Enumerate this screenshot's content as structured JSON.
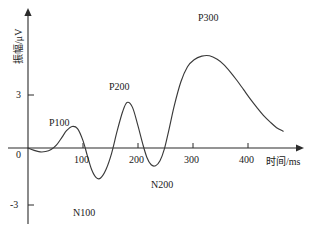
{
  "chart_data": {
    "type": "line",
    "title": "",
    "xlabel": "时间/ms",
    "ylabel": "振幅/μV",
    "xlim": [
      0,
      470
    ],
    "ylim": [
      -3.6,
      6.2
    ],
    "grid": false,
    "legend": "none",
    "x_ticks": [
      {
        "value": 100,
        "label": "100"
      },
      {
        "value": 200,
        "label": "200"
      },
      {
        "value": 300,
        "label": "300"
      },
      {
        "value": 400,
        "label": "400"
      }
    ],
    "y_ticks": [
      {
        "value": 3,
        "label": "3"
      },
      {
        "value": 0,
        "label": "0"
      },
      {
        "value": -3,
        "label": "-3"
      }
    ],
    "series": [
      {
        "name": "ERP waveform",
        "color": "#3a3a3a",
        "x": [
          0,
          10,
          22,
          32,
          42,
          52,
          62,
          70,
          80,
          90,
          100,
          108,
          116,
          124,
          132,
          142,
          152,
          162,
          172,
          180,
          190,
          200,
          208,
          216,
          224,
          232,
          240,
          248,
          256,
          266,
          278,
          290,
          302,
          316,
          330,
          344,
          356,
          368,
          380,
          392,
          404,
          416,
          428,
          440,
          452,
          464
        ],
        "y": [
          0.0,
          -0.12,
          -0.22,
          -0.2,
          -0.08,
          0.18,
          0.62,
          0.98,
          1.22,
          1.1,
          0.42,
          -0.45,
          -1.25,
          -1.68,
          -1.7,
          -1.2,
          -0.3,
          0.95,
          2.05,
          2.58,
          2.3,
          1.25,
          0.3,
          -0.52,
          -0.95,
          -1.0,
          -0.72,
          -0.05,
          1.0,
          2.4,
          3.75,
          4.6,
          5.0,
          5.2,
          5.22,
          5.02,
          4.72,
          4.3,
          3.82,
          3.3,
          2.78,
          2.3,
          1.85,
          1.48,
          1.15,
          0.95
        ]
      }
    ],
    "annotations": [
      {
        "name": "P100",
        "label": "P100",
        "x": 80,
        "y": 1.22,
        "peak": "positive"
      },
      {
        "name": "N100",
        "label": "N100",
        "x": 128,
        "y": -1.7,
        "peak": "negative"
      },
      {
        "name": "P200",
        "label": "P200",
        "x": 178,
        "y": 2.58,
        "peak": "positive"
      },
      {
        "name": "N200",
        "label": "N200",
        "x": 228,
        "y": -1.0,
        "peak": "negative"
      },
      {
        "name": "P300",
        "label": "P300",
        "x": 332,
        "y": 5.22,
        "peak": "positive"
      }
    ]
  },
  "axes": {
    "x_title": "时间/ms",
    "y_title": "振幅/μV"
  },
  "tick_labels": {
    "x": [
      "100",
      "200",
      "300",
      "400"
    ],
    "y_top": "3",
    "y_zero": "0",
    "y_bottom": "-3"
  },
  "peaks": {
    "p100": "P100",
    "n100": "N100",
    "p200": "P200",
    "n200": "N200",
    "p300": "P300"
  },
  "colors": {
    "waveform": "#3a3a3a",
    "axis": "#2b2b2b",
    "background": "#ffffff"
  }
}
